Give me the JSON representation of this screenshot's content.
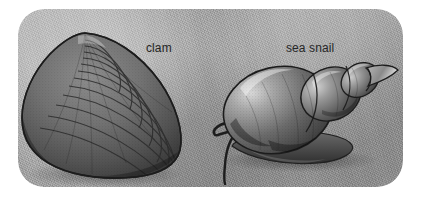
{
  "figure": {
    "kind": "scientific-illustration",
    "background_color": "#ffffff",
    "panel_color": "#9b9b9b",
    "ink_color": "#262626"
  },
  "labels": {
    "clam": "clam",
    "sea_snail": "sea snail"
  },
  "specimens": [
    {
      "name": "clam",
      "label": "clam",
      "common_group": "bivalve",
      "shell_form": "two-valve fan shell with concentric growth rings"
    },
    {
      "name": "sea snail",
      "label": "sea snail",
      "common_group": "gastropod",
      "shell_form": "spiral conical shell with body whorl, foot and tentacles"
    }
  ]
}
